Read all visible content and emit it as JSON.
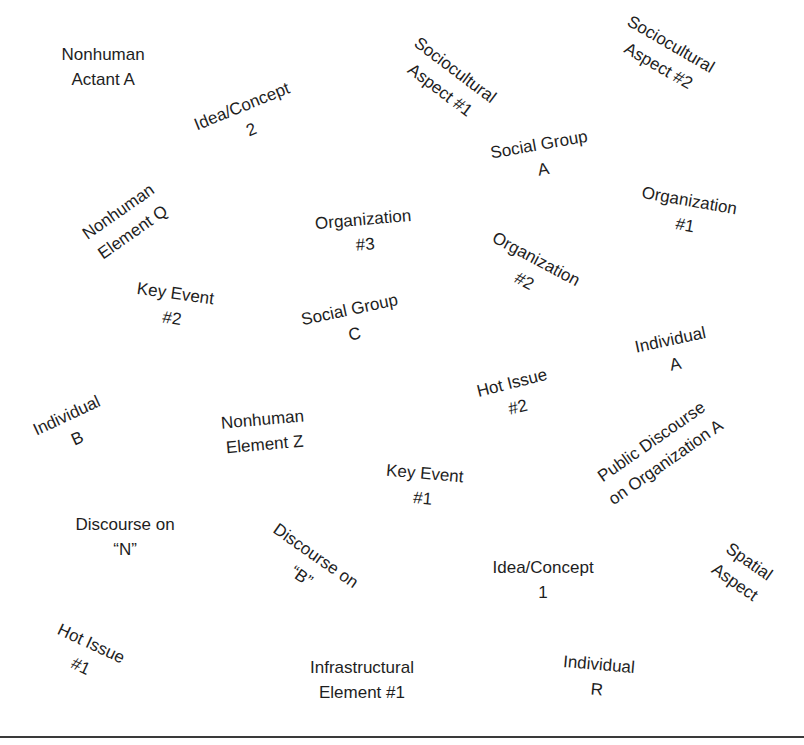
{
  "map": {
    "elements": [
      {
        "id": "nonhuman-actant-a",
        "lines": [
          "Nonhuman",
          "Actant A"
        ],
        "cx": 103,
        "cy": 67,
        "rotate": 0
      },
      {
        "id": "idea-concept-2",
        "lines": [
          "Idea/Concept",
          "2"
        ],
        "cx": 246,
        "cy": 118,
        "rotate": -22
      },
      {
        "id": "sociocultural-aspect-1",
        "lines": [
          "Sociocultural",
          "Aspect #1"
        ],
        "cx": 447,
        "cy": 80,
        "rotate": 37
      },
      {
        "id": "sociocultural-aspect-2",
        "lines": [
          "Sociocultural",
          "Aspect #2"
        ],
        "cx": 664,
        "cy": 55,
        "rotate": 30
      },
      {
        "id": "social-group-a",
        "lines": [
          "Social Group",
          "A"
        ],
        "cx": 541,
        "cy": 157,
        "rotate": -10
      },
      {
        "id": "organization-1",
        "lines": [
          "Organization",
          "#1"
        ],
        "cx": 687,
        "cy": 213,
        "rotate": 10
      },
      {
        "id": "nonhuman-element-q",
        "lines": [
          "Nonhuman",
          "Element Q"
        ],
        "cx": 125,
        "cy": 222,
        "rotate": -35
      },
      {
        "id": "organization-3",
        "lines": [
          "Organization",
          "#3"
        ],
        "cx": 364,
        "cy": 232,
        "rotate": -5
      },
      {
        "id": "organization-2",
        "lines": [
          "Organization",
          "#2"
        ],
        "cx": 530,
        "cy": 270,
        "rotate": 28
      },
      {
        "id": "key-event-2",
        "lines": [
          "Key Event",
          "#2"
        ],
        "cx": 174,
        "cy": 306,
        "rotate": 8
      },
      {
        "id": "social-group-c",
        "lines": [
          "Social Group",
          "C"
        ],
        "cx": 352,
        "cy": 322,
        "rotate": -12
      },
      {
        "id": "individual-a",
        "lines": [
          "Individual",
          "A"
        ],
        "cx": 673,
        "cy": 352,
        "rotate": -12
      },
      {
        "id": "hot-issue-2",
        "lines": [
          "Hot Issue",
          "#2"
        ],
        "cx": 515,
        "cy": 395,
        "rotate": -14
      },
      {
        "id": "individual-b",
        "lines": [
          "Individual",
          "B"
        ],
        "cx": 72,
        "cy": 427,
        "rotate": -25
      },
      {
        "id": "nonhuman-element-z",
        "lines": [
          "Nonhuman",
          "Element Z"
        ],
        "cx": 263,
        "cy": 432,
        "rotate": -5
      },
      {
        "id": "key-event-1",
        "lines": [
          "Key Event",
          "#1"
        ],
        "cx": 424,
        "cy": 486,
        "rotate": 5
      },
      {
        "id": "public-discourse-org-a",
        "lines": [
          "Public Discourse",
          "on Organization A"
        ],
        "cx": 658,
        "cy": 452,
        "rotate": -35
      },
      {
        "id": "discourse-on-n",
        "lines": [
          "Discourse on",
          "“N”"
        ],
        "cx": 125,
        "cy": 537,
        "rotate": 0
      },
      {
        "id": "discourse-on-b",
        "lines": [
          "Discourse on",
          "“B”"
        ],
        "cx": 308,
        "cy": 566,
        "rotate": 35
      },
      {
        "id": "idea-concept-1",
        "lines": [
          "Idea/Concept",
          "1"
        ],
        "cx": 543,
        "cy": 580,
        "rotate": 0
      },
      {
        "id": "spatial-aspect",
        "lines": [
          "Spatial",
          "Aspect"
        ],
        "cx": 742,
        "cy": 572,
        "rotate": 35
      },
      {
        "id": "hot-issue-1",
        "lines": [
          "Hot Issue",
          "#1"
        ],
        "cx": 86,
        "cy": 655,
        "rotate": 25
      },
      {
        "id": "infrastructural-element-1",
        "lines": [
          "Infrastructural",
          "Element #1"
        ],
        "cx": 362,
        "cy": 680,
        "rotate": 0
      },
      {
        "id": "individual-r",
        "lines": [
          "Individual",
          "R"
        ],
        "cx": 598,
        "cy": 677,
        "rotate": 5
      }
    ]
  },
  "style": {
    "text_color": "#1e1e1e",
    "rule_color": "#3a3a3a",
    "background": "#ffffff"
  }
}
